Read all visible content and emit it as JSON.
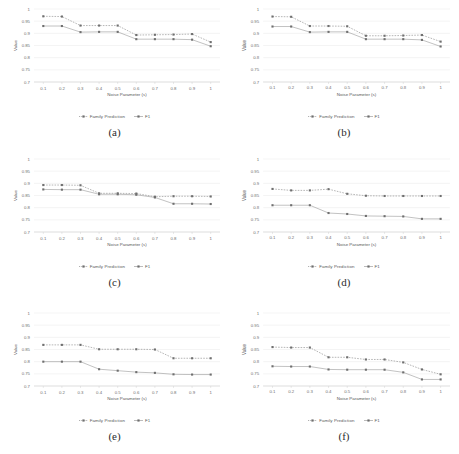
{
  "figure": {
    "y_axis_label": "Value",
    "x_axis_label": "Noise Parameter (s)",
    "legend": [
      {
        "name": "series-family-prediction",
        "label": "Family Prediction"
      },
      {
        "name": "series-f1",
        "label": "F1"
      }
    ],
    "colors": {
      "family_prediction": "#7a7a7a",
      "f1": "#8f8f8f",
      "gridline": "#e2e2e2",
      "axis": "#c9c9c9",
      "text": "#6e6e6e"
    },
    "y_ticks": [
      "0.7",
      "0.75",
      "0.8",
      "0.85",
      "0.9",
      "0.95",
      "1"
    ],
    "x_ticks": [
      "0.1",
      "0.2",
      "0.3",
      "0.4",
      "0.5",
      "0.6",
      "0.7",
      "0.8",
      "0.9",
      "1"
    ]
  },
  "chart_data": [
    {
      "id": "a",
      "caption": "(a)",
      "type": "line",
      "title": "",
      "xlabel": "Noise Parameter (s)",
      "ylabel": "Value",
      "xlim": [
        0.1,
        1
      ],
      "ylim": [
        0.7,
        1
      ],
      "grid": true,
      "legend_position": "bottom",
      "x": [
        0.1,
        0.2,
        0.3,
        0.4,
        0.5,
        0.6,
        0.7,
        0.8,
        0.9,
        1
      ],
      "series": [
        {
          "name": "Family Prediction",
          "values": [
            0.97,
            0.969,
            0.932,
            0.932,
            0.932,
            0.893,
            0.894,
            0.895,
            0.897,
            0.864
          ]
        },
        {
          "name": "F1",
          "values": [
            0.93,
            0.93,
            0.905,
            0.906,
            0.906,
            0.876,
            0.876,
            0.876,
            0.874,
            0.847
          ]
        }
      ]
    },
    {
      "id": "b",
      "caption": "(b)",
      "type": "line",
      "title": "",
      "xlabel": "Noise Parameter (s)",
      "ylabel": "Value",
      "xlim": [
        0.1,
        1
      ],
      "ylim": [
        0.7,
        1
      ],
      "grid": true,
      "legend_position": "bottom",
      "x": [
        0.1,
        0.2,
        0.3,
        0.4,
        0.5,
        0.6,
        0.7,
        0.8,
        0.9,
        1
      ],
      "series": [
        {
          "name": "Family Prediction",
          "values": [
            0.969,
            0.968,
            0.93,
            0.93,
            0.929,
            0.89,
            0.89,
            0.891,
            0.893,
            0.866
          ]
        },
        {
          "name": "F1",
          "values": [
            0.928,
            0.928,
            0.905,
            0.906,
            0.906,
            0.876,
            0.876,
            0.876,
            0.873,
            0.846
          ]
        }
      ]
    },
    {
      "id": "c",
      "caption": "(c)",
      "type": "line",
      "title": "",
      "xlabel": "Noise Parameter (s)",
      "ylabel": "Value",
      "xlim": [
        0.1,
        1
      ],
      "ylim": [
        0.7,
        1
      ],
      "grid": true,
      "legend_position": "bottom",
      "x": [
        0.1,
        0.2,
        0.3,
        0.4,
        0.5,
        0.6,
        0.7,
        0.8,
        0.9,
        1
      ],
      "series": [
        {
          "name": "Family Prediction",
          "values": [
            0.893,
            0.893,
            0.892,
            0.859,
            0.859,
            0.858,
            0.845,
            0.847,
            0.847,
            0.846
          ]
        },
        {
          "name": "F1",
          "values": [
            0.875,
            0.874,
            0.874,
            0.855,
            0.855,
            0.853,
            0.842,
            0.816,
            0.816,
            0.815
          ]
        }
      ]
    },
    {
      "id": "d",
      "caption": "(d)",
      "type": "line",
      "title": "",
      "xlabel": "Noise Parameter (s)",
      "ylabel": "Value",
      "xlim": [
        0.1,
        1
      ],
      "ylim": [
        0.7,
        1
      ],
      "grid": true,
      "legend_position": "bottom",
      "x": [
        0.1,
        0.2,
        0.3,
        0.4,
        0.5,
        0.6,
        0.7,
        0.8,
        0.9,
        1
      ],
      "series": [
        {
          "name": "Family Prediction",
          "values": [
            0.877,
            0.871,
            0.871,
            0.876,
            0.857,
            0.849,
            0.848,
            0.848,
            0.848,
            0.848
          ]
        },
        {
          "name": "F1",
          "values": [
            0.81,
            0.81,
            0.81,
            0.778,
            0.774,
            0.766,
            0.765,
            0.764,
            0.754,
            0.754
          ]
        }
      ]
    },
    {
      "id": "e",
      "caption": "(e)",
      "type": "line",
      "title": "",
      "xlabel": "Noise Parameter (s)",
      "ylabel": "Value",
      "xlim": [
        0.1,
        1
      ],
      "ylim": [
        0.7,
        1
      ],
      "grid": true,
      "legend_position": "bottom",
      "x": [
        0.1,
        0.2,
        0.3,
        0.4,
        0.5,
        0.6,
        0.7,
        0.8,
        0.9,
        1
      ],
      "series": [
        {
          "name": "Family Prediction",
          "values": [
            0.869,
            0.869,
            0.869,
            0.851,
            0.851,
            0.851,
            0.85,
            0.814,
            0.814,
            0.814
          ]
        },
        {
          "name": "F1",
          "values": [
            0.8,
            0.8,
            0.8,
            0.769,
            0.763,
            0.757,
            0.754,
            0.748,
            0.747,
            0.747
          ]
        }
      ]
    },
    {
      "id": "f",
      "caption": "(f)",
      "type": "line",
      "title": "",
      "xlabel": "Noise Parameter (s)",
      "ylabel": "Value",
      "xlim": [
        0.1,
        1
      ],
      "ylim": [
        0.7,
        1
      ],
      "grid": true,
      "legend_position": "bottom",
      "x": [
        0.1,
        0.2,
        0.3,
        0.4,
        0.5,
        0.6,
        0.7,
        0.8,
        0.9,
        1
      ],
      "series": [
        {
          "name": "Family Prediction",
          "values": [
            0.86,
            0.858,
            0.858,
            0.818,
            0.818,
            0.809,
            0.809,
            0.797,
            0.768,
            0.748
          ]
        },
        {
          "name": "F1",
          "values": [
            0.781,
            0.78,
            0.78,
            0.768,
            0.767,
            0.767,
            0.767,
            0.756,
            0.727,
            0.727
          ]
        }
      ]
    }
  ]
}
